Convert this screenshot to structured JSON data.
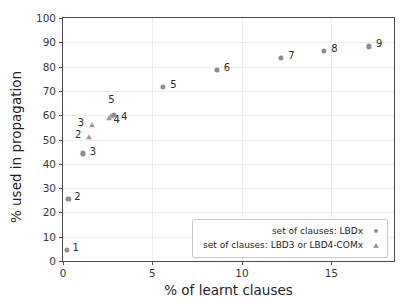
{
  "chart_data": {
    "type": "scatter",
    "title": "",
    "xlabel": "% of learnt clauses",
    "ylabel": "% used in propagation",
    "xlim": [
      0,
      18.5
    ],
    "ylim": [
      0,
      100
    ],
    "xticks": [
      0,
      5,
      10,
      15
    ],
    "yticks": [
      0,
      10,
      20,
      30,
      40,
      50,
      60,
      70,
      80,
      90,
      100
    ],
    "grid": true,
    "legend_position": "lower right",
    "series": [
      {
        "name": "set of clauses: LBDx",
        "marker": "circle",
        "color": "#8d8d8d",
        "points": [
          {
            "label": "1",
            "x": 0.2,
            "y": 4.5
          },
          {
            "label": "2",
            "x": 0.3,
            "y": 25.5
          },
          {
            "label": "3",
            "x": 1.1,
            "y": 44.3
          },
          {
            "label": "4",
            "x": 2.85,
            "y": 60.2
          },
          {
            "label": "5",
            "x": 5.6,
            "y": 71.5
          },
          {
            "label": "6",
            "x": 8.6,
            "y": 78.8
          },
          {
            "label": "7",
            "x": 12.2,
            "y": 83.5
          },
          {
            "label": "8",
            "x": 14.6,
            "y": 86.3
          },
          {
            "label": "9",
            "x": 17.1,
            "y": 88.3
          }
        ]
      },
      {
        "name": "set of clauses: LBD3 or LBD4-COMx",
        "marker": "triangle",
        "color": "#9a9a9a",
        "points": [
          {
            "label": "2",
            "x": 1.45,
            "y": 51.0
          },
          {
            "label": "3",
            "x": 1.6,
            "y": 55.8
          },
          {
            "label": "4",
            "x": 2.55,
            "y": 58.8
          },
          {
            "label": "5",
            "x": 2.7,
            "y": 59.6
          }
        ]
      }
    ]
  },
  "legend": {
    "entries": [
      {
        "text": "set of clauses: LBDx",
        "marker": "circle"
      },
      {
        "text": "set of clauses: LBD3 or LBD4-COMx",
        "marker": "triangle"
      }
    ]
  },
  "label_offsets": {
    "circle": [
      {
        "dx": 6,
        "dy": 3
      },
      {
        "dx": 6,
        "dy": 3
      },
      {
        "dx": 7,
        "dy": 4
      },
      {
        "dx": 7,
        "dy": 7
      },
      {
        "dx": 7,
        "dy": 3
      },
      {
        "dx": 7,
        "dy": 3
      },
      {
        "dx": 7,
        "dy": 3
      },
      {
        "dx": 7,
        "dy": 3
      },
      {
        "dx": 7,
        "dy": 3
      }
    ],
    "triangle": [
      {
        "dx": -14,
        "dy": 3
      },
      {
        "dx": -14,
        "dy": 3
      },
      {
        "dx": 5,
        "dy": 7
      },
      {
        "dx": -3,
        "dy": -11
      }
    ]
  }
}
